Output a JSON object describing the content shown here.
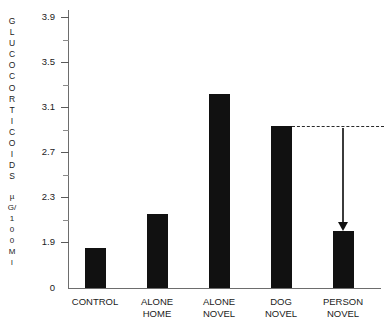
{
  "chart_data": {
    "type": "bar",
    "title": "",
    "subtitle": "",
    "xlabel": "",
    "ylabel": "GLUCOCORTICOIDS µG/100Ml",
    "ylabel_main": "GLUCOCORTICOIDS",
    "ylabel_unit": "µG/100Ml",
    "ylabel_main_chars": [
      "G",
      "L",
      "U",
      "C",
      "O",
      "C",
      "O",
      "R",
      "T",
      "I",
      "C",
      "O",
      "I",
      "D",
      "S"
    ],
    "ylabel_unit_chars": [
      "µ",
      "G/",
      "1",
      "0",
      "0",
      "M",
      "l"
    ],
    "categories": [
      "CONTROL",
      "ALONE HOME",
      "ALONE NOVEL",
      "DOG NOVEL",
      "PERSON NOVEL"
    ],
    "category_lines": [
      [
        "CONTROL",
        ""
      ],
      [
        "ALONE",
        "HOME"
      ],
      [
        "ALONE",
        "NOVEL"
      ],
      [
        "DOG",
        "NOVEL"
      ],
      [
        "PERSON",
        "NOVEL"
      ]
    ],
    "values": [
      1.85,
      2.15,
      3.22,
      2.93,
      2.0
    ],
    "ylim": [
      1.55,
      4.0
    ],
    "baseline_value": 0,
    "yticks": [
      3.9,
      3.5,
      3.1,
      2.7,
      2.3,
      1.9
    ],
    "ytick_labels": [
      "3.9",
      "3.5",
      "3.1",
      "2.7",
      "2.3",
      "1.9"
    ],
    "ytick_zero_label": "0",
    "minor_ticks": true,
    "grid": false,
    "legend": null,
    "bar_color": "#111111",
    "axis_color": "#6d6d6d",
    "annotation": {
      "type": "reference-line-with-arrow",
      "reference_from_category": "DOG NOVEL",
      "reference_value": 2.93,
      "arrow_to_category": "PERSON NOVEL",
      "arrow_to_value": 2.0,
      "style": "dashed"
    }
  }
}
